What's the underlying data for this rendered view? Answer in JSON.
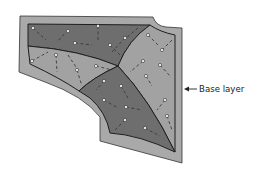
{
  "diagram": {
    "title": "",
    "labels": {
      "base_layer": "Base layer"
    },
    "colors": {
      "base_layer": "#a9a9a9",
      "dark_panel": "#6e6e6e",
      "light_panel": "#a2a2a2",
      "outline": "#1e1e1e",
      "stitch": "#3a3a3a",
      "pin": "#f2f2f2"
    },
    "panels": [
      {
        "name": "top-left-dark-panel",
        "shade": "dark"
      },
      {
        "name": "left-light-panel",
        "shade": "light"
      },
      {
        "name": "right-light-panel",
        "shade": "light"
      },
      {
        "name": "bottom-dark-panel",
        "shade": "dark"
      }
    ]
  }
}
